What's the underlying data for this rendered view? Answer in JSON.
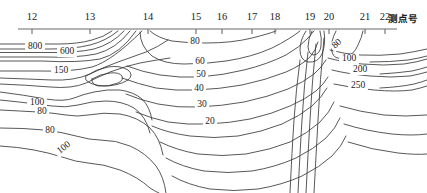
{
  "figure": {
    "name": "contour-section-plot",
    "background": "#ffffff",
    "line_color": "#3a3a3a",
    "axis_color": "#6b6b6b",
    "width": 427,
    "height": 193
  },
  "axis": {
    "title": "测点号",
    "title_x": 388,
    "title_y": 22,
    "line": {
      "x1": 18,
      "x2": 397,
      "y": 29
    },
    "ticks": [
      {
        "label": "12",
        "x": 32
      },
      {
        "label": "13",
        "x": 90
      },
      {
        "label": "14",
        "x": 148
      },
      {
        "label": "15",
        "x": 196
      },
      {
        "label": "16",
        "x": 222
      },
      {
        "label": "17",
        "x": 252
      },
      {
        "label": "18",
        "x": 275
      },
      {
        "label": "19",
        "x": 310
      },
      {
        "label": "20",
        "x": 329
      },
      {
        "label": "21",
        "x": 365
      },
      {
        "label": "22",
        "x": 385
      }
    ],
    "tick_label_y": 20,
    "tick_len": 5
  },
  "chart_data": {
    "type": "contour",
    "title": "",
    "xlabel": "测点号",
    "ylabel": "",
    "xlim": [
      12,
      22
    ],
    "grid": false,
    "legend": "none",
    "levels": [
      20,
      30,
      40,
      50,
      60,
      80,
      100,
      150,
      200,
      250,
      600,
      800
    ],
    "labels": [
      {
        "value": "800",
        "x": 35,
        "y": 47,
        "rotate": 0
      },
      {
        "value": "600",
        "x": 67,
        "y": 52,
        "rotate": 0
      },
      {
        "value": "150",
        "x": 61,
        "y": 71,
        "rotate": 0
      },
      {
        "value": "100",
        "x": 37,
        "y": 103,
        "rotate": 0
      },
      {
        "value": "80",
        "x": 42,
        "y": 112,
        "rotate": 0
      },
      {
        "value": "80",
        "x": 50,
        "y": 131,
        "rotate": 0
      },
      {
        "value": "100",
        "x": 64,
        "y": 148,
        "rotate": -38
      },
      {
        "value": "80",
        "x": 195,
        "y": 42,
        "rotate": 0
      },
      {
        "value": "60",
        "x": 200,
        "y": 62,
        "rotate": 0
      },
      {
        "value": "50",
        "x": 201,
        "y": 75,
        "rotate": 0
      },
      {
        "value": "40",
        "x": 199,
        "y": 89,
        "rotate": 0
      },
      {
        "value": "30",
        "x": 202,
        "y": 105,
        "rotate": 0
      },
      {
        "value": "20",
        "x": 210,
        "y": 122,
        "rotate": 0
      },
      {
        "value": "80",
        "x": 337,
        "y": 44,
        "rotate": -42
      },
      {
        "value": "100",
        "x": 349,
        "y": 59,
        "rotate": 0
      },
      {
        "value": "200",
        "x": 360,
        "y": 70,
        "rotate": 0
      },
      {
        "value": "250",
        "x": 358,
        "y": 86,
        "rotate": 0
      }
    ]
  }
}
